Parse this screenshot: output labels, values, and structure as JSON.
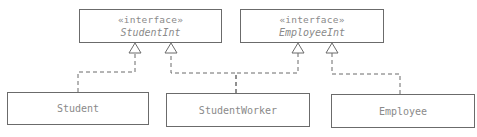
{
  "diagram": {
    "type": "uml-class-diagram",
    "interfaces": [
      {
        "id": "StudentInt",
        "stereotype": "«interface»",
        "name": "StudentInt"
      },
      {
        "id": "EmployeeInt",
        "stereotype": "«interface»",
        "name": "EmployeeInt"
      }
    ],
    "classes": [
      {
        "id": "Student",
        "name": "Student"
      },
      {
        "id": "StudentWorker",
        "name": "StudentWorker"
      },
      {
        "id": "Employee",
        "name": "Employee"
      }
    ],
    "relations": [
      {
        "type": "realization",
        "from": "Student",
        "to": "StudentInt"
      },
      {
        "type": "realization",
        "from": "StudentWorker",
        "to": "StudentInt"
      },
      {
        "type": "realization",
        "from": "StudentWorker",
        "to": "EmployeeInt"
      },
      {
        "type": "realization",
        "from": "Employee",
        "to": "EmployeeInt"
      }
    ],
    "colors": {
      "line": "#6b6b6b",
      "text": "#8a8a8a",
      "background": "#ffffff"
    }
  }
}
